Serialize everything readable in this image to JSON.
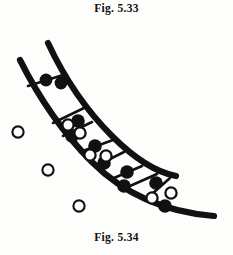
{
  "page": {
    "background_color": "#fdfdfc",
    "ink_color": "#111111",
    "width": 233,
    "height": 255
  },
  "caption_top": {
    "text": "Fig. 5.33",
    "name": "figure-caption-top"
  },
  "caption_bottom": {
    "text": "Fig. 5.34",
    "name": "figure-caption-bottom"
  },
  "diagram": {
    "title": "Fig. 5.34",
    "ink_color": "#111111",
    "outer_curve": {
      "name": "outer-boundary-curve",
      "path": "M 20 34 C 34 62, 58 102, 92 136 C 124 168, 164 186, 214 190",
      "stroke_width": 6.2
    },
    "inner_curve": {
      "name": "inner-boundary-curve",
      "path": "M 48 17 C 62 47, 84 82, 112 110 C 140 138, 160 147, 176 150",
      "stroke_width": 6.2
    },
    "rungs": [
      {
        "name": "rung-1",
        "x1": 28,
        "y1": 60,
        "x2": 63,
        "y2": 49
      },
      {
        "name": "rung-2",
        "x1": 53,
        "y1": 97,
        "x2": 84,
        "y2": 82
      },
      {
        "name": "rung-3",
        "x1": 63,
        "y1": 110,
        "x2": 92,
        "y2": 96
      },
      {
        "name": "rung-4",
        "x1": 80,
        "y1": 126,
        "x2": 113,
        "y2": 114
      },
      {
        "name": "rung-5",
        "x1": 96,
        "y1": 140,
        "x2": 124,
        "y2": 126
      },
      {
        "name": "rung-6",
        "x1": 114,
        "y1": 152,
        "x2": 142,
        "y2": 140
      },
      {
        "name": "rung-7",
        "x1": 130,
        "y1": 160,
        "x2": 157,
        "y2": 148
      },
      {
        "name": "rung-8",
        "x1": 152,
        "y1": 168,
        "x2": 170,
        "y2": 152
      }
    ],
    "filled_circles": [
      {
        "name": "filled-circle-1",
        "cx": 46,
        "cy": 54,
        "r": 6.4
      },
      {
        "name": "filled-circle-2",
        "cx": 61,
        "cy": 57,
        "r": 6.4
      },
      {
        "name": "filled-circle-3",
        "cx": 78,
        "cy": 95,
        "r": 6.8
      },
      {
        "name": "filled-circle-4",
        "cx": 72,
        "cy": 110,
        "r": 6.8
      },
      {
        "name": "filled-circle-5",
        "cx": 95,
        "cy": 120,
        "r": 6.8
      },
      {
        "name": "filled-circle-6",
        "cx": 104,
        "cy": 137,
        "r": 6.8
      },
      {
        "name": "filled-circle-7",
        "cx": 127,
        "cy": 146,
        "r": 6.8
      },
      {
        "name": "filled-circle-8",
        "cx": 124,
        "cy": 160,
        "r": 6.8
      },
      {
        "name": "filled-circle-9",
        "cx": 156,
        "cy": 157,
        "r": 6.8
      },
      {
        "name": "filled-circle-10",
        "cx": 165,
        "cy": 180,
        "r": 6.8
      }
    ],
    "open_circles_in_channel": [
      {
        "name": "open-circle-1",
        "cx": 68,
        "cy": 99,
        "r": 5.6
      },
      {
        "name": "open-circle-2",
        "cx": 80,
        "cy": 107,
        "r": 5.6
      },
      {
        "name": "open-circle-3",
        "cx": 90,
        "cy": 129,
        "r": 5.6
      },
      {
        "name": "open-circle-4",
        "cx": 106,
        "cy": 130,
        "r": 5.6
      },
      {
        "name": "open-circle-5",
        "cx": 152,
        "cy": 172,
        "r": 5.6
      },
      {
        "name": "open-circle-6",
        "cx": 171,
        "cy": 167,
        "r": 5.6
      }
    ],
    "open_circles_outside": [
      {
        "name": "free-open-circle-1",
        "cx": 18,
        "cy": 106,
        "r": 5.6
      },
      {
        "name": "free-open-circle-2",
        "cx": 48,
        "cy": 144,
        "r": 5.6
      },
      {
        "name": "free-open-circle-3",
        "cx": 79,
        "cy": 180,
        "r": 5.6
      }
    ]
  }
}
